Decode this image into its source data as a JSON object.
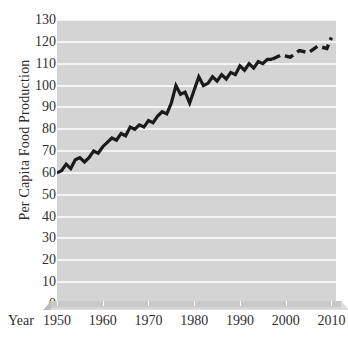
{
  "chart_data": {
    "type": "line",
    "title": "",
    "subtitle": "",
    "xlabel": "Year",
    "ylabel": "Per Capita Food Production",
    "xlim": [
      1950,
      2011
    ],
    "ylim": [
      0,
      130
    ],
    "grid": true,
    "legend": null,
    "yticks": [
      130,
      120,
      110,
      100,
      90,
      80,
      70,
      60,
      50,
      40,
      30,
      20,
      10,
      0
    ],
    "xticks": [
      1950,
      1960,
      1970,
      1980,
      1990,
      2000,
      2010
    ],
    "xtick_labels": [
      "1950",
      "1960",
      "1970",
      "1980",
      "1990",
      "2000",
      "2010"
    ],
    "ytick_labels": [
      "130",
      "120",
      "110",
      "100",
      "90",
      "80",
      "70",
      "60",
      "50",
      "40",
      "30",
      "20",
      "10",
      "0"
    ],
    "series": [
      {
        "name": "Per Capita Food Production",
        "style": "solid",
        "color": "#1a1a1a",
        "x": [
          1950,
          1951,
          1952,
          1953,
          1954,
          1955,
          1956,
          1957,
          1958,
          1959,
          1960,
          1961,
          1962,
          1963,
          1964,
          1965,
          1966,
          1967,
          1968,
          1969,
          1970,
          1971,
          1972,
          1973,
          1974,
          1975,
          1976,
          1977,
          1978,
          1979,
          1980,
          1981,
          1982,
          1983,
          1984,
          1985,
          1986,
          1987,
          1988,
          1989,
          1990,
          1991,
          1992,
          1993,
          1994,
          1995,
          1996,
          1997
        ],
        "values": [
          60,
          61,
          64,
          62,
          66,
          67,
          65,
          67,
          70,
          69,
          72,
          74,
          76,
          75,
          78,
          77,
          81,
          80,
          82,
          81,
          84,
          83,
          86,
          88,
          87,
          92,
          100,
          96,
          97,
          92,
          98,
          104,
          100,
          101,
          104,
          102,
          105,
          103,
          106,
          105,
          109,
          107,
          110,
          108,
          111,
          110,
          112,
          112
        ]
      },
      {
        "name": "Projection",
        "style": "dashed",
        "color": "#1a1a1a",
        "x": [
          1997,
          1999,
          2001,
          2003,
          2005,
          2007,
          2009,
          2010
        ],
        "values": [
          112,
          114,
          113,
          116,
          115,
          118,
          117,
          122
        ]
      }
    ]
  },
  "axes": {
    "y_title": "Per Capita Food Production",
    "x_title": "Year"
  },
  "colors": {
    "plot_background": "#d4d4d4",
    "gridline": "#f4f4f4",
    "line": "#1a1a1a",
    "text": "#2f2f2f",
    "page_background": "#ffffff"
  }
}
